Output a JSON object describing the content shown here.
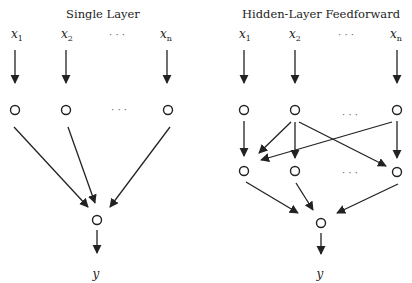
{
  "diagrams": {
    "single_layer": {
      "title": "Single Layer",
      "inputs": [
        {
          "base": "x",
          "sub": "1"
        },
        {
          "base": "x",
          "sub": "2"
        },
        {
          "base": "x",
          "sub": "n"
        }
      ],
      "ellipsis": "· · ·",
      "output": "y",
      "structure": "inputs → one layer of nodes → single output node → y"
    },
    "hidden_layer": {
      "title": "Hidden-Layer Feedforward",
      "inputs": [
        {
          "base": "x",
          "sub": "1"
        },
        {
          "base": "x",
          "sub": "2"
        },
        {
          "base": "x",
          "sub": "n"
        }
      ],
      "ellipsis": "· · ·",
      "output": "y",
      "structure": "inputs → input nodes → hidden nodes (cross-connected) → single output node → y"
    }
  },
  "colors": {
    "stroke": "#222222",
    "background": "#ffffff"
  }
}
